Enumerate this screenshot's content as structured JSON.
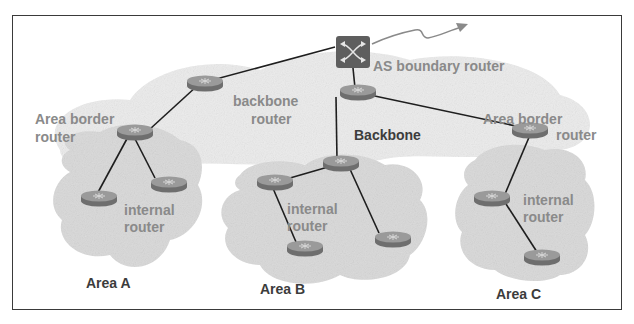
{
  "diagram": {
    "labels": {
      "as_boundary_router": "AS boundary router",
      "backbone_router_line1": "backbone",
      "backbone_router_line2": "router",
      "backbone": "Backbone",
      "area_border_router_a_line1": "Area border",
      "area_border_router_a_line2": "router",
      "area_border_router_c_line1": "Area border",
      "area_border_router_c_line2": "router",
      "internal_router_a_line1": "internal",
      "internal_router_a_line2": "router",
      "internal_router_b_line1": "internal",
      "internal_router_b_line2": "router",
      "internal_router_c_line1": "internal",
      "internal_router_c_line2": "router",
      "area_a": "Area A",
      "area_b": "Area B",
      "area_c": "Area C"
    },
    "nodes": [
      {
        "id": "asbr",
        "type": "switch-icon",
        "x": 350,
        "y": 40
      },
      {
        "id": "backbone-router-left",
        "type": "router-icon",
        "x": 205,
        "y": 83
      },
      {
        "id": "backbone-router-center",
        "type": "router-icon",
        "x": 358,
        "y": 92
      },
      {
        "id": "abr-a",
        "type": "router-icon",
        "x": 135,
        "y": 131
      },
      {
        "id": "abr-b",
        "type": "router-icon",
        "x": 341,
        "y": 163
      },
      {
        "id": "abr-c",
        "type": "router-icon",
        "x": 530,
        "y": 130
      },
      {
        "id": "a1",
        "type": "router-icon",
        "x": 99,
        "y": 198
      },
      {
        "id": "a2",
        "type": "router-icon",
        "x": 169,
        "y": 183
      },
      {
        "id": "b1",
        "type": "router-icon",
        "x": 275,
        "y": 182
      },
      {
        "id": "b2",
        "type": "router-icon",
        "x": 305,
        "y": 247
      },
      {
        "id": "b3",
        "type": "router-icon",
        "x": 393,
        "y": 238
      },
      {
        "id": "c1",
        "type": "router-icon",
        "x": 492,
        "y": 198
      },
      {
        "id": "c2",
        "type": "router-icon",
        "x": 542,
        "y": 257
      }
    ],
    "links": [
      [
        "asbr",
        "backbone-router-left"
      ],
      [
        "asbr",
        "backbone-router-center"
      ],
      [
        "backbone-router-left",
        "abr-a"
      ],
      [
        "backbone-router-center",
        "abr-c"
      ],
      [
        "backbone-router-center",
        "abr-b"
      ],
      [
        "abr-a",
        "a1"
      ],
      [
        "abr-a",
        "a2"
      ],
      [
        "abr-b",
        "b1"
      ],
      [
        "abr-b",
        "b3"
      ],
      [
        "b1",
        "b2"
      ],
      [
        "abr-c",
        "c1"
      ],
      [
        "c1",
        "c2"
      ]
    ],
    "colors": {
      "router_fill": "#7a7a7a",
      "router_top": "#9a9a9a",
      "switch_fill": "#5e5e5e",
      "cloud": "#dcdcdc",
      "label_gray": "#8a8a8a",
      "label_dark": "#3c3c3c",
      "link": "#1e1e1e"
    }
  }
}
